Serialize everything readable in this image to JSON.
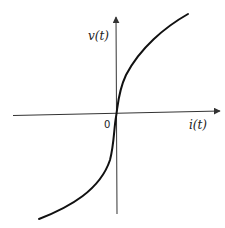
{
  "diagram": {
    "type": "characteristic-curve",
    "y_axis_label": "v(t)",
    "x_axis_label": "i(t)",
    "origin_label": "0",
    "curve_description": "monotonically increasing nonlinear curve through origin, steep near origin, flattening away (v-i characteristic)",
    "colors": {
      "axes": "#333333",
      "curve": "#111111",
      "background": "#ffffff"
    }
  }
}
